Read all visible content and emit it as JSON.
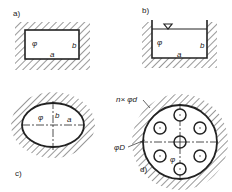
{
  "figure": {
    "colors": {
      "stroke": "#222222",
      "hatch": "#333333",
      "background": "#ffffff"
    },
    "panels": [
      {
        "id": "a",
        "label": "a)",
        "shape": "closed rectangular conduit",
        "dimension_labels": {
          "phi": "φ",
          "height": "b",
          "width": "a"
        }
      },
      {
        "id": "b",
        "label": "b)",
        "shape": "open rectangular channel with free surface",
        "free_surface_symbol": "▽",
        "dimension_labels": {
          "phi": "φ",
          "height": "b",
          "width": "a"
        }
      },
      {
        "id": "c",
        "label": "c)",
        "shape": "elliptical conduit",
        "dimension_labels": {
          "phi": "φ",
          "semi_minor": "b",
          "semi_major": "a"
        }
      },
      {
        "id": "d",
        "label": "d)",
        "shape": "circular pipe containing n smaller tubes",
        "dimension_labels": {
          "phi": "φ",
          "inner_tubes": "n× φd",
          "outer_diameter": "φD"
        },
        "inner_tube_count": 7
      }
    ]
  }
}
